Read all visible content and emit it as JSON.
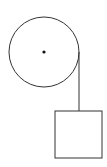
{
  "diagram": {
    "stroke_color": "#333333",
    "background": "#ffffff",
    "pulley": {
      "cx": 44,
      "cy": 52,
      "r": 35,
      "axle_r": 1.6
    },
    "string": {
      "x": 79,
      "y1": 52,
      "y2": 111
    },
    "block": {
      "x": 55,
      "y": 111,
      "width": 47,
      "height": 47
    }
  }
}
